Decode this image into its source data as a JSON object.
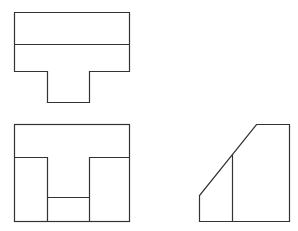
{
  "diagram": {
    "type": "three-view orthographic drawing",
    "stroke_color": "#333333",
    "background": "#ffffff",
    "views": [
      {
        "name": "top-view",
        "description": "T-shaped outline with horizontal dividing line"
      },
      {
        "name": "front-view",
        "description": "Rectangle with central U-shaped notch and inner step line"
      },
      {
        "name": "side-view",
        "description": "Trapezoid with chamfered upper-left edge and internal vertical line"
      }
    ]
  }
}
